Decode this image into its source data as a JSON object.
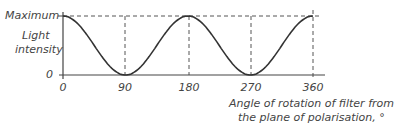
{
  "chart_data": {
    "type": "line",
    "title": "",
    "xlabel": "Angle of rotation of filter from the plane of polarisation, °",
    "xlabel_lines": [
      "Angle of rotation of filter from",
      "the plane of polarisation, °"
    ],
    "ylabel": "Light intensity",
    "ylabel_lines": [
      "Light",
      "intensity"
    ],
    "x_ticks": [
      "0",
      "90",
      "180",
      "270",
      "360"
    ],
    "y_ticks": [
      "0",
      "Maximum"
    ],
    "xlim": [
      0,
      360
    ],
    "ylim": [
      0,
      1
    ],
    "grid": false,
    "reference_lines": {
      "horizontal_dashed_at": "Maximum",
      "vertical_dashed_at": [
        90,
        180,
        270,
        360
      ]
    },
    "series": [
      {
        "name": "Light intensity (cos² θ)",
        "x": [
          0,
          45,
          90,
          135,
          180,
          225,
          270,
          315,
          360
        ],
        "y": [
          1,
          0.5,
          0,
          0.5,
          1,
          0.5,
          0,
          0.5,
          1
        ]
      }
    ],
    "colors": {
      "curve": "#333333",
      "axes": "#444444",
      "dashed": "#555555",
      "text": "#444444"
    }
  }
}
